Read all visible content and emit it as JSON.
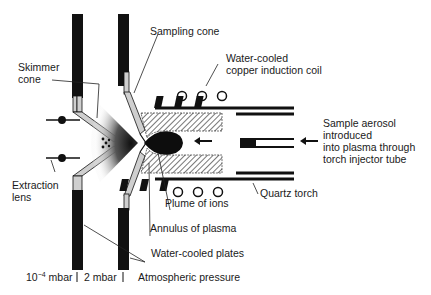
{
  "diagram": {
    "labels": {
      "sampling_cone": "Sampling cone",
      "coil_line1": "Water-cooled",
      "coil_line2": "copper induction coil",
      "skimmer_line1": "Skimmer",
      "skimmer_line2": "cone",
      "aerosol_line1": "Sample aerosol",
      "aerosol_line2": "introduced",
      "aerosol_line3": "into plasma through",
      "aerosol_line4": "torch injector tube",
      "extraction_line1": "Extraction",
      "extraction_line2": "lens",
      "quartz_torch": "Quartz torch",
      "plume": "Plume of ions",
      "annulus": "Annulus of plasma",
      "plates": "Water-cooled plates"
    },
    "pressure_zones": {
      "zone1_prefix": "10",
      "zone1_exp": "−4",
      "zone1_unit": " mbar",
      "zone2": "2 mbar",
      "zone3": "Atmospheric pressure"
    },
    "colors": {
      "ink": "#111111",
      "cone_fill": "#bdbdbd",
      "hatch": "#555555"
    }
  }
}
